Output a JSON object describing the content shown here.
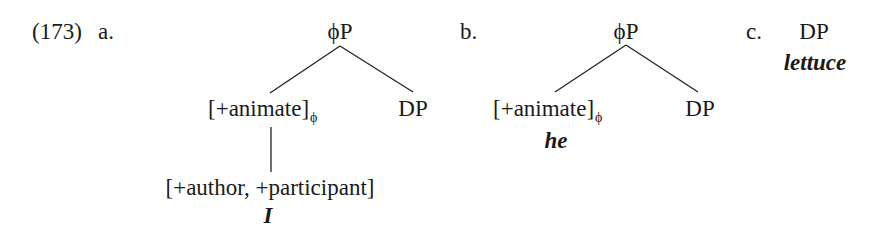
{
  "example_number": "(173)",
  "trees": {
    "a": {
      "label": "a.",
      "root": "ϕP",
      "left_child": {
        "text": "[+animate]",
        "subscript": "ϕ"
      },
      "right_child": "DP",
      "grandchild": "[+author, +participant]",
      "exponent": "I"
    },
    "b": {
      "label": "b.",
      "root": "ϕP",
      "left_child": {
        "text": "[+animate]",
        "subscript": "ϕ"
      },
      "right_child": "DP",
      "exponent": "he"
    },
    "c": {
      "label": "c.",
      "root": "DP",
      "exponent": "lettuce"
    }
  }
}
